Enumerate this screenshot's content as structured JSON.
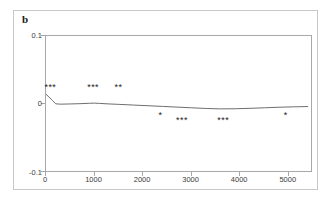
{
  "panel": {
    "label": "b"
  },
  "chart_data": {
    "type": "line",
    "title": "",
    "subtitle": "",
    "xlabel": "",
    "ylabel": "",
    "xlim": [
      0,
      5500
    ],
    "ylim": [
      -0.1,
      0.1
    ],
    "grid": false,
    "legend": "none",
    "yticks": [
      "0.1",
      "0",
      "-0.1"
    ],
    "ytick_values": [
      0.1,
      0,
      -0.1
    ],
    "xticks": [
      "0",
      "1000",
      "2000",
      "3000",
      "4000",
      "5000"
    ],
    "xtick_values": [
      0,
      1000,
      2000,
      3000,
      4000,
      5000
    ],
    "series": [
      {
        "name": "correlation",
        "color": "#6e6e6e",
        "x": [
          0,
          60,
          130,
          200,
          300,
          500,
          700,
          900,
          1000,
          1100,
          1300,
          1500,
          1800,
          2100,
          2400,
          2700,
          3000,
          3300,
          3600,
          3900,
          4200,
          4500,
          4800,
          5100,
          5400
        ],
        "y": [
          0.015,
          0.011,
          0.006,
          0.001,
          0.0005,
          0.0008,
          0.0012,
          0.0018,
          0.002,
          0.0016,
          0.0008,
          0.0002,
          -0.0008,
          -0.0018,
          -0.0028,
          -0.0038,
          -0.0048,
          -0.0058,
          -0.0064,
          -0.0062,
          -0.0056,
          -0.0048,
          -0.004,
          -0.0034,
          -0.003
        ]
      }
    ],
    "annotations": [
      {
        "text": "***",
        "x": 120,
        "y": 0.022,
        "position": "above"
      },
      {
        "text": "***",
        "x": 1000,
        "y": 0.022,
        "position": "above"
      },
      {
        "text": "**",
        "x": 1520,
        "y": 0.022,
        "position": "above"
      },
      {
        "text": "*",
        "x": 2380,
        "y": -0.018,
        "position": "below"
      },
      {
        "text": "***",
        "x": 2830,
        "y": -0.026,
        "position": "below"
      },
      {
        "text": "***",
        "x": 3680,
        "y": -0.026,
        "position": "below"
      },
      {
        "text": "*",
        "x": 4960,
        "y": -0.018,
        "position": "below"
      }
    ]
  }
}
